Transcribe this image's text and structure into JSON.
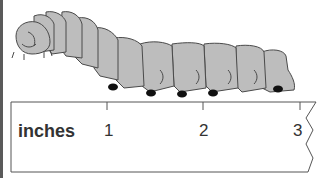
{
  "figure": {
    "ruler": {
      "unit_label": "inches",
      "tick_labels": [
        "1",
        "2",
        "3"
      ]
    }
  },
  "colors": {
    "body_fill": "#bdbdbd",
    "outline": "#4a4a4a",
    "feet": "#111111",
    "ruler_line": "#555555"
  }
}
